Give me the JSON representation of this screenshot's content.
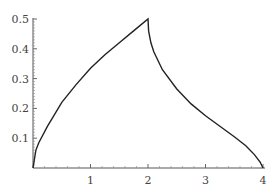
{
  "chart_data": {
    "type": "line",
    "title": "",
    "xlabel": "",
    "ylabel": "",
    "xlim": [
      0,
      4
    ],
    "ylim": [
      0,
      0.5
    ],
    "grid": false,
    "legend": null,
    "x_ticks": [
      "1",
      "2",
      "3",
      "4"
    ],
    "y_ticks": [
      "0.1",
      "0.2",
      "0.3",
      "0.4",
      "0.5"
    ],
    "series": [
      {
        "name": "curve",
        "color": "#222222",
        "x": [
          0,
          0.05,
          0.1,
          0.25,
          0.5,
          0.75,
          1.0,
          1.25,
          1.5,
          1.75,
          2.0,
          2.01,
          2.05,
          2.1,
          2.25,
          2.5,
          2.75,
          3.0,
          3.25,
          3.5,
          3.7,
          3.85,
          3.95,
          4.0
        ],
        "values": [
          0,
          0.06,
          0.085,
          0.14,
          0.22,
          0.28,
          0.335,
          0.38,
          0.42,
          0.46,
          0.5,
          0.46,
          0.42,
          0.39,
          0.33,
          0.265,
          0.215,
          0.175,
          0.14,
          0.105,
          0.075,
          0.045,
          0.02,
          0
        ]
      }
    ]
  },
  "axes": {
    "x_tick_labels": [
      "1",
      "2",
      "3",
      "4"
    ],
    "y_tick_labels": [
      "0.1",
      "0.2",
      "0.3",
      "0.4",
      "0.5"
    ]
  }
}
